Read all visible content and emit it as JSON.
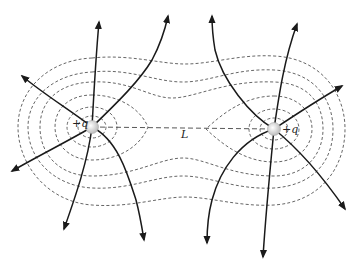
{
  "figure": {
    "type": "electric field lines and equipotential surfaces of two equal positive point charges",
    "charges": [
      {
        "id": "left",
        "label": "+q",
        "x": 92,
        "y": 127
      },
      {
        "id": "right",
        "label": "+q",
        "x": 274,
        "y": 129
      }
    ],
    "separation": {
      "label": "L"
    },
    "colors": {
      "field_line": "#1a1a1a",
      "equipotential": "#555555",
      "charge_fill": "#d8d8d8"
    }
  }
}
